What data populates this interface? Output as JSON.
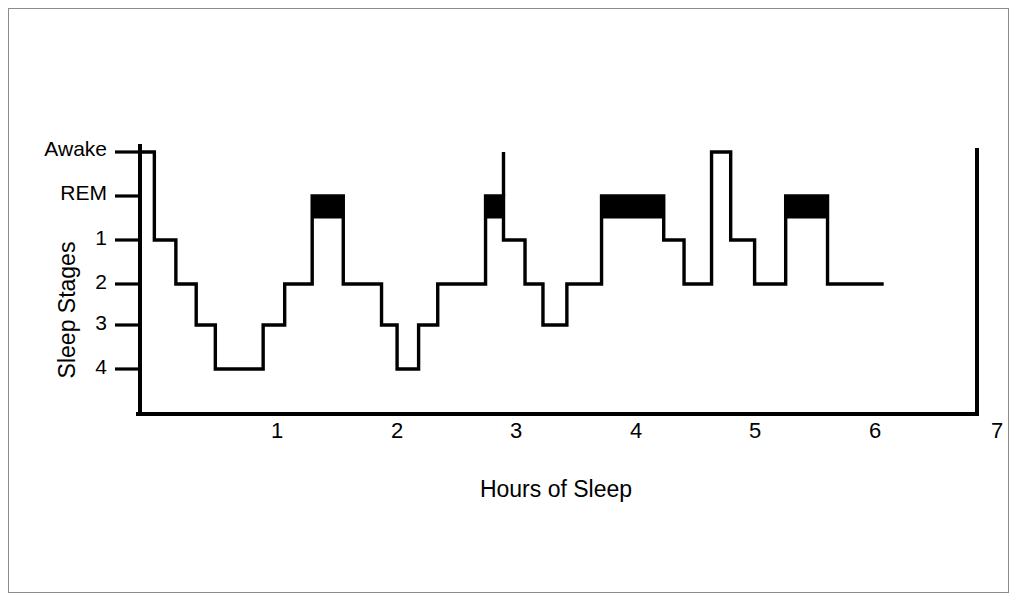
{
  "figure": {
    "background_color": "#ffffff",
    "ink_color": "#000000",
    "frame_color": "#8c8c8c"
  },
  "chart_data": {
    "type": "line",
    "subtype": "hypnogram-step",
    "title": "",
    "xlabel": "Hours of Sleep",
    "ylabel": "Sleep Stages",
    "x_tick_labels": [
      "1",
      "2",
      "3",
      "4",
      "5",
      "6",
      "7"
    ],
    "x_tick_values": [
      1,
      2,
      3,
      4,
      5,
      6,
      7
    ],
    "xlim": [
      0,
      7
    ],
    "y_tick_labels": [
      "Awake",
      "REM",
      "1",
      "2",
      "3",
      "4"
    ],
    "y_levels": [
      "Awake",
      "REM",
      "1",
      "2",
      "3",
      "4"
    ],
    "y_level_order": "Awake at top, stage 4 at bottom",
    "grid": false,
    "legend": false,
    "rem_marker": "filled black bar drawn between REM and stage 1 level",
    "series": [
      {
        "name": "Sleep stage",
        "step_segments": [
          {
            "stage": "Awake",
            "x_start": 0.0,
            "x_end": 0.12
          },
          {
            "stage": "1",
            "x_start": 0.12,
            "x_end": 0.3
          },
          {
            "stage": "2",
            "x_start": 0.3,
            "x_end": 0.47
          },
          {
            "stage": "3",
            "x_start": 0.47,
            "x_end": 0.63
          },
          {
            "stage": "4",
            "x_start": 0.63,
            "x_end": 1.03
          },
          {
            "stage": "3",
            "x_start": 1.03,
            "x_end": 1.21
          },
          {
            "stage": "2",
            "x_start": 1.21,
            "x_end": 1.44
          },
          {
            "stage": "REM",
            "x_start": 1.44,
            "x_end": 1.7
          },
          {
            "stage": "2",
            "x_start": 1.7,
            "x_end": 2.02
          },
          {
            "stage": "3",
            "x_start": 2.02,
            "x_end": 2.15
          },
          {
            "stage": "4",
            "x_start": 2.15,
            "x_end": 2.33
          },
          {
            "stage": "3",
            "x_start": 2.33,
            "x_end": 2.49
          },
          {
            "stage": "2",
            "x_start": 2.49,
            "x_end": 2.89
          },
          {
            "stage": "REM",
            "x_start": 2.89,
            "x_end": 3.04
          },
          {
            "stage": "1",
            "x_start": 3.04,
            "x_end": 3.22
          },
          {
            "stage": "2",
            "x_start": 3.22,
            "x_end": 3.37
          },
          {
            "stage": "3",
            "x_start": 3.37,
            "x_end": 3.57
          },
          {
            "stage": "2",
            "x_start": 3.57,
            "x_end": 3.86
          },
          {
            "stage": "REM",
            "x_start": 3.86,
            "x_end": 4.38
          },
          {
            "stage": "1",
            "x_start": 4.38,
            "x_end": 4.55
          },
          {
            "stage": "2",
            "x_start": 4.55,
            "x_end": 4.78
          },
          {
            "stage": "Awake",
            "x_start": 4.78,
            "x_end": 4.94
          },
          {
            "stage": "1",
            "x_start": 4.94,
            "x_end": 5.14
          },
          {
            "stage": "2",
            "x_start": 5.14,
            "x_end": 5.4
          },
          {
            "stage": "REM",
            "x_start": 5.4,
            "x_end": 5.75
          },
          {
            "stage": "2",
            "x_start": 5.75,
            "x_end": 6.22
          }
        ],
        "rem_episodes": [
          {
            "index": 1,
            "x_start": 1.44,
            "x_end": 1.7,
            "spike_to_awake": false
          },
          {
            "index": 2,
            "x_start": 2.89,
            "x_end": 3.04,
            "spike_to_awake": true
          },
          {
            "index": 3,
            "x_start": 3.86,
            "x_end": 4.38,
            "spike_to_awake": false
          },
          {
            "index": 4,
            "x_start": 5.4,
            "x_end": 5.75,
            "spike_to_awake": false
          }
        ],
        "awake_episodes": [
          {
            "x_start": 0.0,
            "x_end": 0.12
          },
          {
            "x_start": 4.78,
            "x_end": 4.94
          }
        ],
        "trace_end_x": 6.22,
        "trace_end_stage": "2"
      }
    ],
    "annotations": [
      {
        "name": "end-of-axis-rule",
        "x": 7.0,
        "description": "vertical rule closing the plot at hour 7"
      }
    ]
  }
}
